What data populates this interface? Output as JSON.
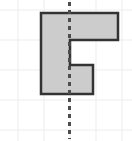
{
  "figure": {
    "title": "",
    "canvas": {
      "width": 132,
      "height": 141,
      "background": "#ffffff"
    },
    "grid": {
      "label": "faint square grid",
      "color": "#ededed",
      "line_width": 1,
      "vertical_lines_x": [
        18,
        44,
        70,
        96,
        122
      ],
      "horizontal_lines_y": [
        10,
        40,
        70,
        100,
        130
      ]
    },
    "shape": {
      "name": "shaded-polygon",
      "fill_color": "#cccccc",
      "stroke_color": "#333333",
      "stroke_width": 2.5,
      "points": "41,13 118,13 118,40 70,40 70,65 93,65 93,94 41,94",
      "vertices": [
        [
          41,
          13
        ],
        [
          118,
          13
        ],
        [
          118,
          40
        ],
        [
          70,
          40
        ],
        [
          70,
          65
        ],
        [
          93,
          65
        ],
        [
          93,
          94
        ],
        [
          41,
          94
        ]
      ]
    },
    "symmetry_line": {
      "name": "vertical dashed line",
      "color": "#4d4d4d",
      "x": 69.5,
      "y_start": 2,
      "y_end": 139,
      "stroke_width": 3,
      "dash_pattern": "4 4"
    }
  }
}
